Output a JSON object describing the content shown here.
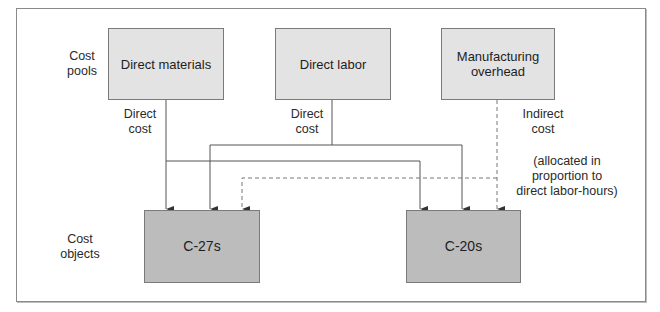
{
  "diagram": {
    "row_labels": {
      "cost_pools": "Cost\npools",
      "cost_objects": "Cost\nobjects"
    },
    "cost_pools": [
      {
        "id": "direct-materials",
        "label": "Direct materials"
      },
      {
        "id": "direct-labor",
        "label": "Direct labor"
      },
      {
        "id": "manufacturing-overhead",
        "label": "Manufacturing\noverhead"
      }
    ],
    "cost_objects": [
      {
        "id": "c-27s",
        "label": "C-27s"
      },
      {
        "id": "c-20s",
        "label": "C-20s"
      }
    ],
    "edge_labels": {
      "direct_materials": "Direct\ncost",
      "direct_labor": "Direct\ncost",
      "overhead": "Indirect\ncost",
      "overhead_note": "(allocated in\nproportion to\ndirect labor-hours)"
    },
    "edges": [
      {
        "from": "direct-materials",
        "to": "c-27s",
        "style": "solid"
      },
      {
        "from": "direct-materials",
        "to": "c-20s",
        "style": "solid"
      },
      {
        "from": "direct-labor",
        "to": "c-27s",
        "style": "solid"
      },
      {
        "from": "direct-labor",
        "to": "c-20s",
        "style": "solid"
      },
      {
        "from": "manufacturing-overhead",
        "to": "c-27s",
        "style": "dashed"
      },
      {
        "from": "manufacturing-overhead",
        "to": "c-20s",
        "style": "dashed"
      }
    ],
    "colors": {
      "pool_fill": "#e3e3e3",
      "object_fill": "#bcbcbc",
      "line": "#555555"
    }
  }
}
